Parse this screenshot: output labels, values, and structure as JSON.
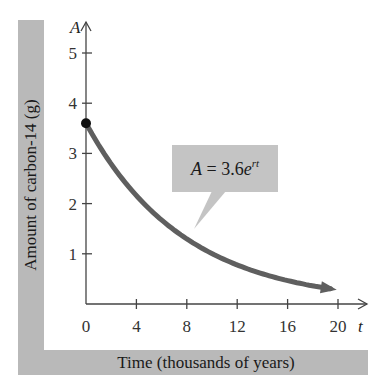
{
  "chart_data": {
    "type": "line",
    "title": "",
    "xlabel": "Time (thousands of years)",
    "ylabel": "Amount of carbon-14 (g)",
    "x_axis_var": "t",
    "y_axis_var": "A",
    "x_ticks": [
      0,
      4,
      8,
      12,
      16,
      20
    ],
    "y_ticks": [
      1,
      2,
      3,
      4,
      5
    ],
    "xlim": [
      0,
      21
    ],
    "ylim": [
      0,
      5.5
    ],
    "grid": false,
    "annotation": {
      "lhs": "A",
      "eq": " = 3.6",
      "base": "e",
      "exponent": "rt"
    },
    "series": [
      {
        "name": "A = 3.6e^(rt)",
        "initial_value": 3.6,
        "x": [
          0,
          2,
          4,
          6,
          8,
          10,
          12,
          14,
          16,
          18,
          20
        ],
        "values": [
          3.6,
          2.79,
          2.16,
          1.67,
          1.3,
          1.0,
          0.78,
          0.6,
          0.47,
          0.36,
          0.28
        ]
      }
    ],
    "marked_point": {
      "t": 0,
      "A": 3.6
    }
  }
}
